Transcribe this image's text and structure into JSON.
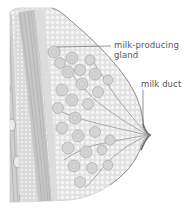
{
  "diagram": {
    "labels": {
      "gland_line1": "milk-producing",
      "gland_line2": "gland",
      "duct": "milk duct"
    },
    "colors": {
      "background": "#ffffff",
      "tissue_fill": "#e4e4e4",
      "fat_cell": "#f4f4f4",
      "muscle": "#c8c8c8",
      "muscle_stroke": "#a8a8a8",
      "lobule": "#d6d6d6",
      "lobule_stroke": "#9c9c9c",
      "outline": "#8a8a8a",
      "leader_line": "#666666",
      "label_text": "#555555"
    }
  }
}
